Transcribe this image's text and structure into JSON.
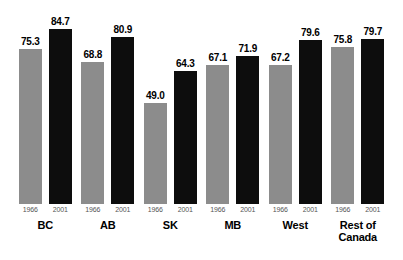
{
  "chart_data": {
    "type": "bar",
    "title": "",
    "subtitle": "",
    "xlabel": "",
    "ylabel": "",
    "ylim": [
      0,
      92
    ],
    "grid": false,
    "legend_position": "none",
    "categories": [
      "BC",
      "AB",
      "SK",
      "MB",
      "West",
      "Rest of Canada"
    ],
    "series": [
      {
        "name": "1966",
        "color": "#8c8c8c",
        "values": [
          75.3,
          68.8,
          49.0,
          67.1,
          67.2,
          75.8
        ]
      },
      {
        "name": "2001",
        "color": "#0d0d0d",
        "values": [
          84.7,
          80.9,
          64.3,
          71.9,
          79.6,
          79.7
        ]
      }
    ],
    "tick_labels": [
      "1966",
      "2001"
    ],
    "value_label_format": "one-decimal"
  },
  "groups": [
    {
      "name": "BC",
      "name_lines": [
        "BC"
      ],
      "bars": [
        {
          "year": "1966",
          "value": "75.3",
          "series": "y1966"
        },
        {
          "year": "2001",
          "value": "84.7",
          "series": "y2001"
        }
      ]
    },
    {
      "name": "AB",
      "name_lines": [
        "AB"
      ],
      "bars": [
        {
          "year": "1966",
          "value": "68.8",
          "series": "y1966"
        },
        {
          "year": "2001",
          "value": "80.9",
          "series": "y2001"
        }
      ]
    },
    {
      "name": "SK",
      "name_lines": [
        "SK"
      ],
      "bars": [
        {
          "year": "1966",
          "value": "49.0",
          "series": "y1966"
        },
        {
          "year": "2001",
          "value": "64.3",
          "series": "y2001"
        }
      ]
    },
    {
      "name": "MB",
      "name_lines": [
        "MB"
      ],
      "bars": [
        {
          "year": "1966",
          "value": "67.1",
          "series": "y1966"
        },
        {
          "year": "2001",
          "value": "71.9",
          "series": "y2001"
        }
      ]
    },
    {
      "name": "West",
      "name_lines": [
        "West"
      ],
      "bars": [
        {
          "year": "1966",
          "value": "67.2",
          "series": "y1966"
        },
        {
          "year": "2001",
          "value": "79.6",
          "series": "y2001"
        }
      ]
    },
    {
      "name": "Rest of Canada",
      "name_lines": [
        "Rest of",
        "Canada"
      ],
      "bars": [
        {
          "year": "1966",
          "value": "75.8",
          "series": "y1966"
        },
        {
          "year": "2001",
          "value": "79.7",
          "series": "y2001"
        }
      ]
    }
  ],
  "colors": {
    "series_1966": "#8c8c8c",
    "series_2001": "#0d0d0d",
    "background": "#ffffff",
    "value_label": "#000000",
    "tick_label": "#555555"
  }
}
